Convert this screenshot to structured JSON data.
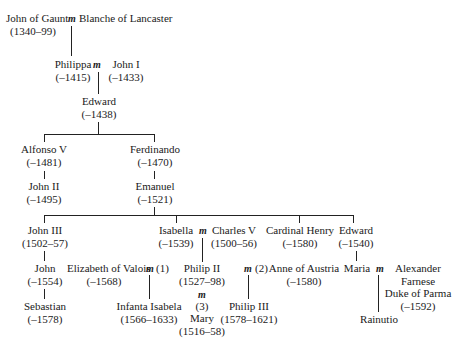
{
  "marriage_symbol": "m",
  "people": {
    "john_of_gaunt": {
      "name": "John of Gaunt",
      "dates": "(1340–99)"
    },
    "blanche": {
      "name": "Blanche of Lancaster"
    },
    "philippa": {
      "name": "Philippa",
      "dates": "(–1415)"
    },
    "john_i": {
      "name": "John I",
      "dates": "(–1433)"
    },
    "edward_1438": {
      "name": "Edward",
      "dates": "(–1438)"
    },
    "alfonso_v": {
      "name": "Alfonso V",
      "dates": "(–1481)"
    },
    "ferdinando": {
      "name": "Ferdinando",
      "dates": "(–1470)"
    },
    "john_ii": {
      "name": "John II",
      "dates": "(–1495)"
    },
    "emanuel": {
      "name": "Emanuel",
      "dates": "(–1521)"
    },
    "john_iii": {
      "name": "John III",
      "dates": "(1502–57)"
    },
    "isabella": {
      "name": "Isabella",
      "dates": "(–1539)"
    },
    "charles_v": {
      "name": "Charles V",
      "dates": "(1500–56)"
    },
    "cardinal_henry": {
      "name": "Cardinal Henry",
      "dates": "(–1580)"
    },
    "edward_1540": {
      "name": "Edward",
      "dates": "(–1540)"
    },
    "john_1554": {
      "name": "John",
      "dates": "(–1554)"
    },
    "elizabeth_valois": {
      "name": "Elizabeth of Valois",
      "dates": "(–1568)",
      "marriage_no": "(1)"
    },
    "philip_ii": {
      "name": "Philip II",
      "dates": "(1527–98)"
    },
    "anne_austria": {
      "name": "Anne of Austria",
      "dates": "(–1580)",
      "marriage_no": "(2)"
    },
    "maria": {
      "name": "Maria"
    },
    "alexander": {
      "name_lines": [
        "Alexander",
        "Farnese",
        "Duke of Parma"
      ],
      "dates": "(–1592)"
    },
    "sebastian": {
      "name": "Sebastian",
      "dates": "(–1578)"
    },
    "infanta_isabela": {
      "name": "Infanta Isabela",
      "dates": "(1566–1633)"
    },
    "mary": {
      "name": "Mary",
      "dates": "(1516–58)",
      "marriage_no": "(3)"
    },
    "philip_iii": {
      "name": "Philip III",
      "dates": "(1578–1621)"
    },
    "rainutio": {
      "name": "Rainutio"
    }
  }
}
